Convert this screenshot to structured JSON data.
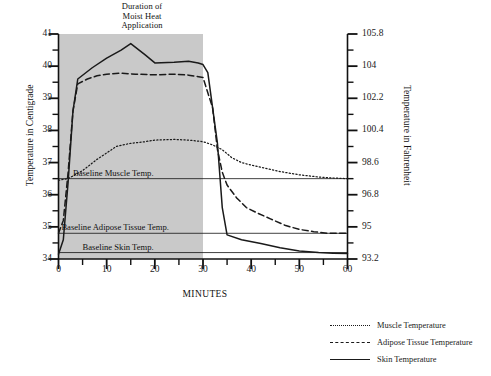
{
  "chart_data": {
    "type": "line",
    "title": "Duration of\nMoist Heat\nApplication",
    "xlabel": "MINUTES",
    "ylabel": "Temperature in Centigrade",
    "ylabel_right": "Temperature in Fahrenheit",
    "xlim": [
      0,
      60
    ],
    "ylim": [
      34,
      41
    ],
    "grid": false,
    "legend_position": "bottom-right",
    "x_ticks": [
      0,
      10,
      20,
      30,
      40,
      50,
      60
    ],
    "x_tick_labels": [
      "0",
      "10",
      "20",
      "30",
      "40",
      "50",
      "60"
    ],
    "x_minor_ticks": [
      5,
      15,
      25,
      35,
      45,
      55
    ],
    "y_ticks": [
      34,
      35,
      36,
      37,
      38,
      39,
      40,
      41
    ],
    "y_tick_labels": [
      "34",
      "35",
      "36",
      "37",
      "38",
      "39",
      "40",
      "41"
    ],
    "y_minor_ticks": [
      34.5,
      35.5,
      36.5,
      37.5,
      38.5,
      39.5,
      40.5
    ],
    "y_ticks_right": [
      34,
      35,
      36,
      37,
      38,
      39,
      40,
      41
    ],
    "y_tick_labels_right": [
      "93.2",
      "95",
      "96.8",
      "98.6",
      "100.4",
      "102.2",
      "104",
      "105.8"
    ],
    "shaded_region": {
      "label": "Duration of Moist Heat Application",
      "x_start": 0,
      "x_end": 30,
      "color": "#bfbfbf"
    },
    "baselines": [
      {
        "name": "Baseline Muscle Temp.",
        "value": 36.5,
        "label_x": 3.0
      },
      {
        "name": "Baseline Adipose Tissue Temp.",
        "value": 34.8,
        "label_x": 0.6
      },
      {
        "name": "Baseline Skin Temp.",
        "value": 34.2,
        "label_x": 5.0
      }
    ],
    "series": [
      {
        "name": "Muscle Temperature",
        "style": "dotted",
        "color": "#1a1a1a",
        "points": [
          [
            0,
            36.45
          ],
          [
            2,
            36.5
          ],
          [
            5,
            36.75
          ],
          [
            8,
            37.1
          ],
          [
            10,
            37.3
          ],
          [
            12,
            37.5
          ],
          [
            15,
            37.6
          ],
          [
            18,
            37.65
          ],
          [
            20,
            37.7
          ],
          [
            24,
            37.72
          ],
          [
            27,
            37.7
          ],
          [
            30,
            37.65
          ],
          [
            32,
            37.55
          ],
          [
            34,
            37.4
          ],
          [
            36,
            37.15
          ],
          [
            38,
            37.0
          ],
          [
            40,
            36.92
          ],
          [
            43,
            36.82
          ],
          [
            46,
            36.72
          ],
          [
            50,
            36.62
          ],
          [
            54,
            36.55
          ],
          [
            57,
            36.52
          ],
          [
            60,
            36.5
          ]
        ]
      },
      {
        "name": "Adipose Tissue Temperature",
        "style": "dashed",
        "color": "#1a1a1a",
        "points": [
          [
            0,
            34.8
          ],
          [
            1,
            35.2
          ],
          [
            2,
            36.7
          ],
          [
            3,
            38.6
          ],
          [
            4,
            39.45
          ],
          [
            6,
            39.6
          ],
          [
            8,
            39.7
          ],
          [
            10,
            39.75
          ],
          [
            13,
            39.78
          ],
          [
            16,
            39.75
          ],
          [
            20,
            39.73
          ],
          [
            24,
            39.75
          ],
          [
            27,
            39.72
          ],
          [
            30,
            39.65
          ],
          [
            32,
            38.7
          ],
          [
            33,
            37.4
          ],
          [
            34,
            36.7
          ],
          [
            35,
            36.3
          ],
          [
            37,
            35.9
          ],
          [
            39,
            35.6
          ],
          [
            41,
            35.45
          ],
          [
            44,
            35.25
          ],
          [
            47,
            35.05
          ],
          [
            50,
            34.92
          ],
          [
            53,
            34.85
          ],
          [
            56,
            34.8
          ],
          [
            60,
            34.8
          ]
        ]
      },
      {
        "name": "Skin Temperature",
        "style": "solid",
        "color": "#1a1a1a",
        "points": [
          [
            0,
            34.15
          ],
          [
            1,
            34.6
          ],
          [
            2,
            36.4
          ],
          [
            3,
            38.6
          ],
          [
            4,
            39.6
          ],
          [
            7,
            39.95
          ],
          [
            10,
            40.25
          ],
          [
            13,
            40.5
          ],
          [
            15,
            40.7
          ],
          [
            18,
            40.35
          ],
          [
            20,
            40.1
          ],
          [
            24,
            40.12
          ],
          [
            27,
            40.15
          ],
          [
            29,
            40.1
          ],
          [
            30,
            40.05
          ],
          [
            31,
            39.8
          ],
          [
            33,
            37.6
          ],
          [
            34,
            35.6
          ],
          [
            35,
            34.75
          ],
          [
            38,
            34.6
          ],
          [
            42,
            34.48
          ],
          [
            46,
            34.35
          ],
          [
            50,
            34.25
          ],
          [
            54,
            34.2
          ],
          [
            57,
            34.18
          ],
          [
            60,
            34.17
          ]
        ]
      }
    ]
  },
  "legend": {
    "items": [
      {
        "label": "Muscle Temperature",
        "style": "dotted"
      },
      {
        "label": "Adipose Tissue Temperature",
        "style": "dashed"
      },
      {
        "label": "Skin Temperature",
        "style": "solid"
      }
    ]
  }
}
